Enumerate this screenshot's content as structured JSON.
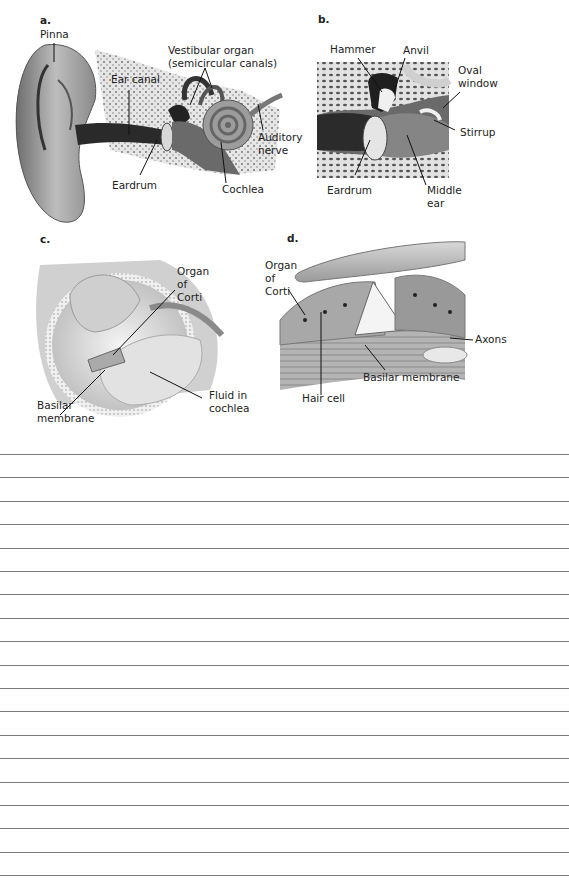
{
  "figure": {
    "panels": [
      {
        "id": "a",
        "letter": "a.",
        "labels": {
          "pinna": "Pinna",
          "ear_canal": "Ear canal",
          "vestibular_line1": "Vestibular organ",
          "vestibular_line2": "(semicircular canals)",
          "auditory_line1": "Auditory",
          "auditory_line2": "nerve",
          "eardrum": "Eardrum",
          "cochlea": "Cochlea"
        }
      },
      {
        "id": "b",
        "letter": "b.",
        "labels": {
          "hammer": "Hammer",
          "anvil": "Anvil",
          "oval_line1": "Oval",
          "oval_line2": "window",
          "stirrup": "Stirrup",
          "eardrum": "Eardrum",
          "middle_line1": "Middle",
          "middle_line2": "ear"
        }
      },
      {
        "id": "c",
        "letter": "c.",
        "labels": {
          "organ_line1": "Organ",
          "organ_line2": "of",
          "organ_line3": "Corti",
          "basilar_line1": "Basilar",
          "basilar_line2": "membrane",
          "fluid_line1": "Fluid in",
          "fluid_line2": "cochlea"
        }
      },
      {
        "id": "d",
        "letter": "d.",
        "labels": {
          "organ_line1": "Organ",
          "organ_line2": "of",
          "organ_line3": "Corti",
          "axons": "Axons",
          "basilar": "Basilar membrane",
          "hair_cell": "Hair cell"
        }
      }
    ]
  },
  "answer_lines": {
    "count": 19,
    "first_y": 454,
    "spacing": 23.4,
    "color": "#7a7a7a"
  }
}
